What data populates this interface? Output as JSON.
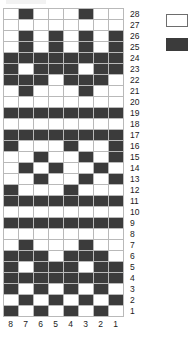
{
  "chart_data": {
    "type": "heatmap",
    "title": "",
    "xlabel": "",
    "ylabel": "",
    "grid": true,
    "legend_position": "right",
    "columns": 8,
    "rows": 28,
    "value_names": {
      "0": "light",
      "1": "dark"
    },
    "colors": {
      "light": "#ffffff",
      "dark": "#3b3b3b",
      "gridline": "#b9b9b9"
    },
    "column_labels": [
      "8",
      "7",
      "6",
      "5",
      "4",
      "3",
      "2",
      "1"
    ],
    "row_labels": [
      "28",
      "27",
      "26",
      "25",
      "24",
      "23",
      "22",
      "21",
      "20",
      "19",
      "18",
      "17",
      "14",
      "13",
      "12",
      "11",
      "10",
      "9",
      "8",
      "7",
      "6",
      "5",
      "4",
      "3",
      "2",
      "1"
    ],
    "rows_top_to_bottom": [
      {
        "label": "28",
        "cells": [
          0,
          1,
          0,
          0,
          0,
          1,
          0,
          0
        ]
      },
      {
        "label": "27",
        "cells": [
          0,
          0,
          0,
          0,
          0,
          0,
          0,
          0
        ]
      },
      {
        "label": "26",
        "cells": [
          0,
          1,
          0,
          1,
          0,
          1,
          0,
          1
        ]
      },
      {
        "label": "25",
        "cells": [
          0,
          1,
          0,
          1,
          0,
          1,
          0,
          1
        ]
      },
      {
        "label": "24",
        "cells": [
          1,
          1,
          1,
          1,
          1,
          1,
          1,
          1
        ]
      },
      {
        "label": "23",
        "cells": [
          1,
          0,
          1,
          1,
          1,
          0,
          1,
          1
        ]
      },
      {
        "label": "22",
        "cells": [
          1,
          1,
          1,
          0,
          1,
          1,
          1,
          0
        ]
      },
      {
        "label": "21",
        "cells": [
          0,
          1,
          0,
          0,
          0,
          1,
          0,
          0
        ]
      },
      {
        "label": "20",
        "cells": [
          0,
          0,
          0,
          0,
          0,
          0,
          0,
          0
        ]
      },
      {
        "label": "19",
        "cells": [
          1,
          1,
          1,
          1,
          1,
          1,
          1,
          1
        ]
      },
      {
        "label": "18",
        "cells": [
          0,
          0,
          0,
          0,
          0,
          0,
          0,
          0
        ]
      },
      {
        "label": "17",
        "cells": [
          1,
          1,
          1,
          1,
          1,
          1,
          1,
          1
        ]
      },
      {
        "label": "16",
        "cells": [
          1,
          0,
          0,
          0,
          1,
          0,
          0,
          1
        ]
      },
      {
        "label": "15",
        "cells": [
          0,
          0,
          1,
          0,
          0,
          1,
          0,
          1
        ]
      },
      {
        "label": "14",
        "cells": [
          0,
          1,
          0,
          1,
          0,
          0,
          1,
          0
        ]
      },
      {
        "label": "13",
        "cells": [
          0,
          0,
          1,
          0,
          0,
          1,
          0,
          1
        ]
      },
      {
        "label": "12",
        "cells": [
          1,
          0,
          0,
          0,
          1,
          0,
          0,
          0
        ]
      },
      {
        "label": "11",
        "cells": [
          1,
          1,
          1,
          1,
          1,
          1,
          1,
          1
        ]
      },
      {
        "label": "10",
        "cells": [
          0,
          0,
          0,
          0,
          0,
          0,
          0,
          0
        ]
      },
      {
        "label": "9",
        "cells": [
          1,
          1,
          1,
          1,
          1,
          1,
          1,
          1
        ]
      },
      {
        "label": "8",
        "cells": [
          0,
          0,
          0,
          0,
          0,
          0,
          0,
          0
        ]
      },
      {
        "label": "7",
        "cells": [
          0,
          1,
          0,
          0,
          0,
          1,
          0,
          0
        ]
      },
      {
        "label": "6",
        "cells": [
          1,
          1,
          1,
          0,
          1,
          1,
          1,
          0
        ]
      },
      {
        "label": "5",
        "cells": [
          1,
          0,
          1,
          1,
          1,
          0,
          1,
          1
        ]
      },
      {
        "label": "4",
        "cells": [
          1,
          1,
          1,
          1,
          1,
          1,
          1,
          1
        ]
      },
      {
        "label": "3",
        "cells": [
          1,
          0,
          1,
          0,
          1,
          0,
          1,
          0
        ]
      },
      {
        "label": "2",
        "cells": [
          0,
          1,
          0,
          1,
          0,
          1,
          0,
          1
        ]
      },
      {
        "label": "1",
        "cells": [
          1,
          0,
          1,
          0,
          1,
          0,
          1,
          0
        ]
      }
    ]
  },
  "legend": {
    "entries": [
      {
        "name": "light-swatch",
        "value": "light",
        "label": ""
      },
      {
        "name": "dark-swatch",
        "value": "dark",
        "label": ""
      }
    ]
  }
}
